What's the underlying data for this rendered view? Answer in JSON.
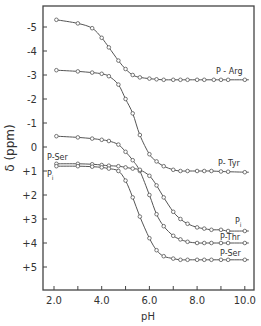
{
  "chart_data": {
    "type": "line",
    "title": "",
    "xlabel": "pH",
    "ylabel": "δ (ppm)",
    "xlim": [
      1.6,
      10.4
    ],
    "ylim": [
      -5.9,
      6.0
    ],
    "y_inverted": true,
    "grid": false,
    "legend": "inline labels at right end of curves",
    "x_ticks": [
      "2.0",
      "4.0",
      "6.0",
      "8.0",
      "10.0"
    ],
    "x_minor_ticks": [
      3.0,
      5.0,
      7.0,
      9.0
    ],
    "y_ticks": [
      "-5",
      "-4",
      "-3",
      "-2",
      "-1",
      "0",
      "+1",
      "+2",
      "+3",
      "+4",
      "+5"
    ],
    "y_tick_values": [
      -5,
      -4,
      -3,
      -2,
      -1,
      0,
      1,
      2,
      3,
      4,
      5
    ],
    "series": [
      {
        "name": "P-Arg",
        "label": "P - Arg",
        "x": [
          2.1,
          3.0,
          3.6,
          4.0,
          4.3,
          4.7,
          5.0,
          5.3,
          5.6,
          6.0,
          6.3,
          6.6,
          7.0,
          7.3,
          7.6,
          8.0,
          8.3,
          8.7,
          9.0,
          9.3,
          10.0
        ],
        "y": [
          -5.3,
          -5.15,
          -4.95,
          -4.55,
          -4.15,
          -3.6,
          -3.25,
          -3.0,
          -2.9,
          -2.85,
          -2.82,
          -2.8,
          -2.8,
          -2.8,
          -2.8,
          -2.8,
          -2.8,
          -2.8,
          -2.8,
          -2.8,
          -2.8
        ]
      },
      {
        "name": "P-Tyr",
        "label": "P- Tyr",
        "x": [
          2.1,
          3.0,
          3.6,
          4.0,
          4.3,
          4.7,
          5.0,
          5.3,
          5.6,
          6.0,
          6.3,
          6.6,
          7.0,
          7.3,
          7.6,
          8.0,
          8.3,
          8.6,
          9.0,
          9.3,
          10.0
        ],
        "y": [
          -3.2,
          -3.15,
          -3.1,
          -3.05,
          -2.95,
          -2.6,
          -2.0,
          -1.4,
          -0.5,
          0.3,
          0.6,
          0.8,
          0.95,
          1.0,
          1.0,
          1.0,
          1.0,
          1.0,
          1.02,
          1.03,
          1.05
        ]
      },
      {
        "name": "P-Thr",
        "label": "P-Thr",
        "x": [
          2.1,
          3.0,
          3.6,
          4.0,
          4.3,
          4.7,
          5.0,
          5.3,
          5.6,
          6.0,
          6.3,
          6.6,
          7.0,
          7.3,
          7.6,
          8.0,
          8.3,
          8.6,
          9.0,
          9.3,
          10.0
        ],
        "y": [
          -0.45,
          -0.4,
          -0.35,
          -0.3,
          -0.25,
          -0.1,
          0.2,
          0.55,
          1.0,
          2.0,
          2.8,
          3.3,
          3.7,
          3.85,
          3.95,
          4.0,
          4.0,
          4.0,
          4.0,
          4.0,
          4.0
        ]
      },
      {
        "name": "Pi",
        "label": "Pi",
        "x": [
          2.1,
          3.0,
          3.6,
          4.0,
          4.3,
          4.7,
          5.0,
          5.3,
          5.6,
          6.0,
          6.3,
          6.6,
          7.0,
          7.3,
          7.6,
          8.0,
          8.3,
          8.6,
          9.0,
          9.3,
          10.0
        ],
        "y": [
          0.7,
          0.7,
          0.72,
          0.75,
          0.78,
          0.8,
          0.85,
          0.9,
          0.95,
          1.2,
          1.6,
          2.1,
          2.7,
          3.0,
          3.2,
          3.35,
          3.4,
          3.45,
          3.45,
          3.5,
          3.5
        ]
      },
      {
        "name": "P-Ser",
        "label": "P-Ser",
        "x": [
          2.1,
          3.0,
          3.6,
          4.0,
          4.3,
          4.7,
          5.0,
          5.3,
          5.6,
          6.0,
          6.3,
          6.6,
          7.0,
          7.3,
          7.6,
          8.0,
          8.3,
          8.6,
          9.0,
          9.3,
          10.0
        ],
        "y": [
          0.8,
          0.8,
          0.82,
          0.85,
          0.9,
          1.0,
          1.4,
          2.1,
          2.9,
          3.8,
          4.3,
          4.55,
          4.65,
          4.7,
          4.7,
          4.7,
          4.7,
          4.7,
          4.7,
          4.7,
          4.7
        ]
      }
    ],
    "annotations": [
      {
        "text": "P-Ser",
        "near": "left, pH 2.1, δ +0.5"
      },
      {
        "text": "Pi",
        "near": "left, pH 2.1, δ +1.1"
      }
    ]
  },
  "labels": {
    "x_axis_title": "pH",
    "y_axis_title": "δ (ppm)",
    "left_p_ser": "P-Ser",
    "left_pi": "P",
    "left_pi_sub": "i",
    "right_pi": "P",
    "right_pi_sub": "i"
  },
  "colors": {
    "line": "#555555",
    "marker_fill": "#ffffff",
    "axis": "#444444",
    "text": "#333333"
  }
}
